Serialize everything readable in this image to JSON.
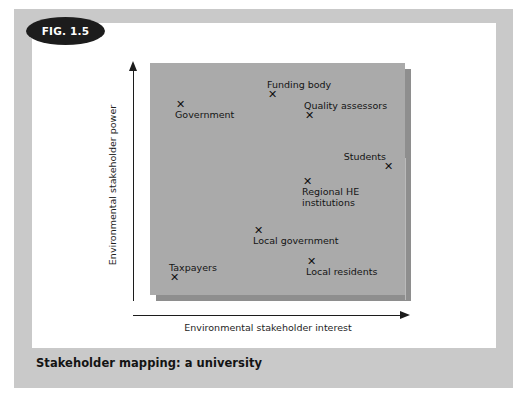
{
  "figure": {
    "badge_label": "FIG. 1.5",
    "caption": "Stakeholder mapping: a university"
  },
  "chart_data": {
    "type": "scatter",
    "title": "Stakeholder mapping: a university",
    "xlabel": "Environmental stakeholder interest",
    "ylabel": "Environmental stakeholder power",
    "xlim": [
      0,
      100
    ],
    "ylim": [
      0,
      100
    ],
    "grid": false,
    "legend": "none",
    "annotations": [
      "Faint vertical divider line near mid-plot"
    ],
    "points": [
      {
        "label": "Government",
        "x": 11,
        "y": 86,
        "label_pos": "below"
      },
      {
        "label": "Funding body",
        "x": 47,
        "y": 90,
        "label_pos": "above"
      },
      {
        "label": "Quality assessors",
        "x": 62,
        "y": 80,
        "label_pos": "above"
      },
      {
        "label": "Students",
        "x": 94,
        "y": 61,
        "label_pos": "above-right"
      },
      {
        "label": "Regional HE\ninstitutions",
        "x": 61,
        "y": 52,
        "label_pos": "below"
      },
      {
        "label": "Local government",
        "x": 42,
        "y": 28,
        "label_pos": "below"
      },
      {
        "label": "Taxpayers",
        "x": 8,
        "y": 9,
        "label_pos": "above"
      },
      {
        "label": "Local residents",
        "x": 62,
        "y": 14,
        "label_pos": "below"
      }
    ],
    "marker_glyph": "✕"
  },
  "points_render": [
    {
      "name": "government",
      "marker": "✕",
      "label": "Government",
      "left": 176,
      "top": 101,
      "cls": "lbl-below"
    },
    {
      "name": "funding-body",
      "marker": "✕",
      "label": "Funding body",
      "left": 268,
      "top": 91,
      "cls": "lbl-above"
    },
    {
      "name": "quality-assessors",
      "marker": "✕",
      "label": "Quality assessors",
      "left": 305,
      "top": 112,
      "cls": "lbl-above"
    },
    {
      "name": "students",
      "marker": "✕",
      "label": "Students",
      "left": 384,
      "top": 163,
      "cls": "lbl-above-right"
    },
    {
      "name": "regional-he-institutions",
      "marker": "✕",
      "label": "Regional HE",
      "label2": "institutions",
      "left": 303,
      "top": 178,
      "cls": "lbl-below"
    },
    {
      "name": "local-government",
      "marker": "✕",
      "label": "Local government",
      "left": 254,
      "top": 227,
      "cls": "lbl-below"
    },
    {
      "name": "taxpayers",
      "marker": "✕",
      "label": "Taxpayers",
      "left": 170,
      "top": 274,
      "cls": "lbl-above"
    },
    {
      "name": "local-residents",
      "marker": "✕",
      "label": "Local residents",
      "left": 307,
      "top": 258,
      "cls": "lbl-below"
    }
  ]
}
